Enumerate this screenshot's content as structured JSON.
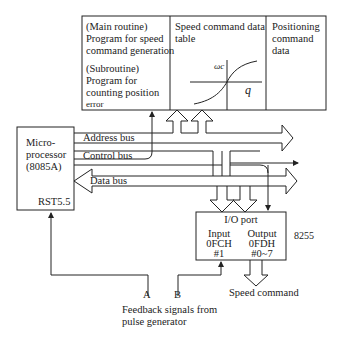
{
  "top_block": {
    "main_routine": {
      "title": "(Main routine)",
      "lines": [
        "Program for speed",
        "command generation"
      ]
    },
    "subroutine": {
      "title": "(Subroutine)",
      "lines": [
        "Program for",
        "counting position",
        "error"
      ]
    },
    "speed_table": {
      "lines": [
        "Speed command data",
        "table"
      ],
      "curve_y_label": "ωc",
      "curve_x_label": "q"
    },
    "positioning": {
      "lines": [
        "Positioning",
        "command",
        "data"
      ]
    }
  },
  "microprocessor": {
    "lines": [
      "Micro-",
      "processor",
      "(8085A)"
    ],
    "interrupt_pin": "RST5.5"
  },
  "buses": {
    "address": "Address bus",
    "control": "Control bus",
    "data": "Data bus"
  },
  "io_port": {
    "title": "I/O port",
    "chip": "8255",
    "input": {
      "label": "Input",
      "address": "0FCH",
      "bit": "#1"
    },
    "output": {
      "label": "Output",
      "address": "0FDH",
      "bit": "#0~7"
    }
  },
  "signals": {
    "a": "A",
    "b": "B",
    "feedback_lines": [
      "Feedback signals from",
      "pulse generator"
    ],
    "speed_command": "Speed command"
  },
  "colors": {
    "line": "#222222",
    "background": "#ffffff"
  }
}
